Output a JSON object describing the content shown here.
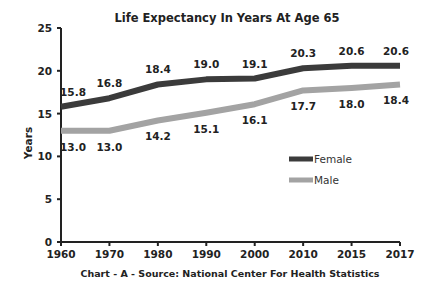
{
  "chart_data": {
    "type": "line",
    "title": "Life Expectancy In Years At Age 65",
    "xlabel": "Chart - A - Source: National Center For Health Statistics",
    "ylabel": "Years",
    "ylim": [
      0,
      25
    ],
    "yticks": [
      0,
      5,
      10,
      15,
      20,
      25
    ],
    "categories": [
      "1960",
      "1970",
      "1980",
      "1990",
      "2000",
      "2010",
      "2015",
      "2017"
    ],
    "grid": false,
    "legend_position": "center-right",
    "series": [
      {
        "name": "Female",
        "color": "#3b3b3b",
        "values": [
          15.8,
          16.8,
          18.4,
          19.0,
          19.1,
          20.3,
          20.6,
          20.6
        ],
        "labels": [
          "15.8",
          "16.8",
          "18.4",
          "19.0",
          "19.1",
          "20.3",
          "20.6",
          "20.6"
        ]
      },
      {
        "name": "Male",
        "color": "#a3a3a3",
        "values": [
          13.0,
          13.0,
          14.2,
          15.1,
          16.1,
          17.7,
          18.0,
          18.4
        ],
        "labels": [
          "13.0",
          "13.0",
          "14.2",
          "15.1",
          "16.1",
          "17.7",
          "18.0",
          "18.4"
        ]
      }
    ]
  }
}
